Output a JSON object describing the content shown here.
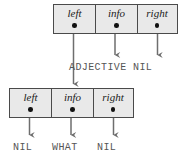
{
  "diagram": {
    "colors": {
      "box_fill": "#e9e9e9",
      "box_border": "#4a4a4a",
      "dot": "#111111",
      "arrow": "#6e6e6e",
      "caption_text": "#555555",
      "field_text": "#1a1a1a",
      "background": "#ffffff"
    },
    "nodes": [
      {
        "id": "parent-node",
        "fields": [
          {
            "name": "left",
            "label": "left"
          },
          {
            "name": "info",
            "label": "info"
          },
          {
            "name": "right",
            "label": "right"
          }
        ]
      },
      {
        "id": "child-node",
        "fields": [
          {
            "name": "left",
            "label": "left"
          },
          {
            "name": "info",
            "label": "info"
          },
          {
            "name": "right",
            "label": "right"
          }
        ]
      }
    ],
    "captions": {
      "parent_info_value": "ADJECTIVE",
      "parent_right_value": "NIL",
      "child_left_value": "NIL",
      "child_info_value": "WHAT",
      "child_right_value": "NIL"
    },
    "edges": [
      {
        "from": "parent-node.left",
        "to": "child-node",
        "kind": "pointer-arrow"
      },
      {
        "from": "parent-node.info",
        "to": "ADJECTIVE",
        "kind": "pointer-arrow"
      },
      {
        "from": "parent-node.right",
        "to": "NIL",
        "kind": "pointer-arrow"
      },
      {
        "from": "child-node.left",
        "to": "NIL",
        "kind": "pointer-arrow"
      },
      {
        "from": "child-node.info",
        "to": "WHAT",
        "kind": "pointer-arrow"
      },
      {
        "from": "child-node.right",
        "to": "NIL",
        "kind": "pointer-arrow"
      }
    ]
  }
}
